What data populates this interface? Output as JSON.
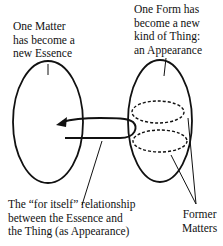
{
  "diagram": {
    "labels": {
      "essence": "One Matter\nhas become a\nnew Essence",
      "appearance": "One Form has\nbecome a new\nkind of Thing:\nan Appearance",
      "relationship": "The “for itself” relationship\nbetween the Essence and\nthe Thing (as Appearance)",
      "former_matters": "Former\nMatters"
    },
    "shapes": {
      "left_ellipse": "Essence",
      "right_ellipse": "Appearance",
      "dashed_ellipses": [
        "Former Matter 1",
        "Former Matter 2"
      ],
      "arrow": "for-itself relationship"
    },
    "colors": {
      "stroke": "#111111",
      "background": "#ffffff"
    }
  }
}
